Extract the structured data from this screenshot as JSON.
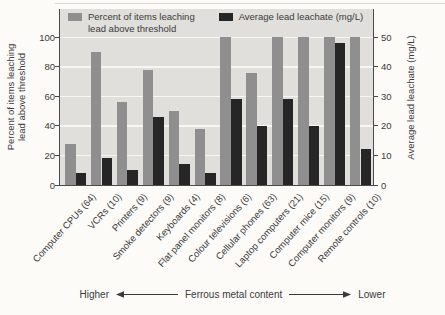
{
  "chart_data": {
    "type": "bar",
    "categories": [
      "Computer CPUs (64)",
      "VCRs (10)",
      "Printers (9)",
      "Smoke detectors (9)",
      "Keyboards (4)",
      "Flat panel monitors (8)",
      "Colour televisions (6)",
      "Cellular phones (63)",
      "Laptop computers (21)",
      "Computer mice (15)",
      "Computer monitors (9)",
      "Remote controls (10)"
    ],
    "series": [
      {
        "name": "Percent of items leaching lead above threshold",
        "axis": "left",
        "unit": "%",
        "values": [
          28,
          90,
          56,
          78,
          50,
          38,
          100,
          76,
          100,
          100,
          100,
          100
        ]
      },
      {
        "name": "Average lead leachate (mg/L)",
        "axis": "right",
        "unit": "mg/L",
        "values": [
          4,
          9,
          5,
          23,
          7,
          4,
          29,
          20,
          29,
          20,
          48,
          12
        ]
      }
    ],
    "left_axis": {
      "label": "Percent of items leaching lead above threshold",
      "lines": [
        "Percent of items leaching",
        "lead above threshold"
      ],
      "ticks": [
        0,
        20,
        40,
        60,
        80,
        100
      ],
      "range": [
        0,
        100
      ]
    },
    "right_axis": {
      "label": "Average lead leachate (mg/L)",
      "ticks": [
        0,
        10,
        20,
        30,
        40,
        50
      ],
      "range": [
        0,
        50
      ]
    },
    "grid": true,
    "legend_position": "top-inside",
    "footer": {
      "left_label": "Higher",
      "center_label": "Ferrous metal content",
      "right_label": "Lower"
    }
  },
  "legend": {
    "percent_lines": [
      "Percent of items leaching",
      "lead above threshold"
    ],
    "leachate_label": "Average lead leachate (mg/L)"
  },
  "colors": {
    "percent_bar": "#8f8f8f",
    "leachate_bar": "#262626",
    "plot_bg": "#e0dfdc",
    "gridline": "#f7f6f3",
    "axis": "#4b4b4b",
    "text": "#3a3a3a"
  }
}
